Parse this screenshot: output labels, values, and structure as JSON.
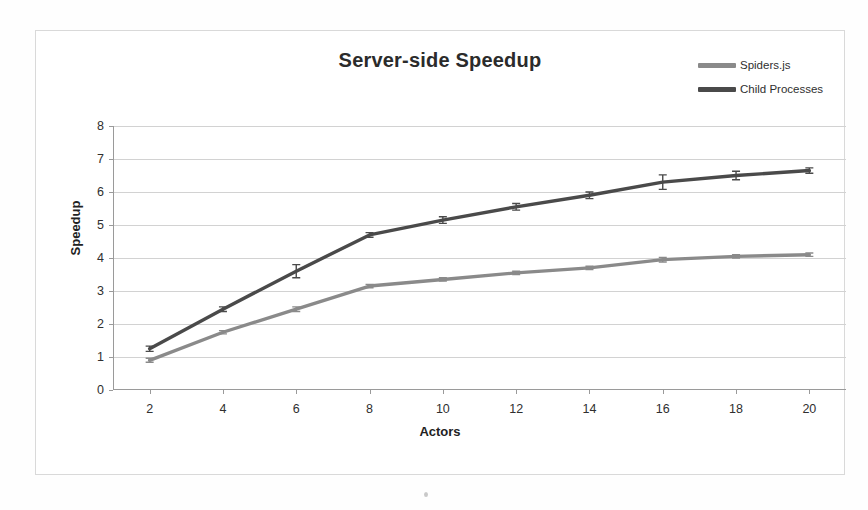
{
  "chart_data": {
    "type": "line",
    "title": "Server-side Speedup",
    "xlabel": "Actors",
    "ylabel": "Speedup",
    "x": [
      2,
      4,
      6,
      8,
      10,
      12,
      14,
      16,
      18,
      20
    ],
    "xlim": [
      1,
      21
    ],
    "ylim": [
      0,
      8
    ],
    "ytick_labels": [
      "0",
      "1",
      "2",
      "3",
      "4",
      "5",
      "6",
      "7",
      "8"
    ],
    "xtick_labels": [
      "2",
      "4",
      "6",
      "8",
      "10",
      "12",
      "14",
      "16",
      "18",
      "20"
    ],
    "grid": "horizontal",
    "legend_position": "top-right",
    "series": [
      {
        "name": "Spiders.js",
        "color": "#8a8a8a",
        "values": [
          0.9,
          1.75,
          2.45,
          3.15,
          3.35,
          3.55,
          3.7,
          3.95,
          4.05,
          4.1
        ],
        "error": [
          0.06,
          0.05,
          0.07,
          0.05,
          0.05,
          0.05,
          0.05,
          0.07,
          0.05,
          0.05
        ]
      },
      {
        "name": "Child Processes",
        "color": "#4a4a4a",
        "values": [
          1.25,
          2.45,
          3.6,
          4.7,
          5.15,
          5.55,
          5.9,
          6.3,
          6.5,
          6.65
        ],
        "error": [
          0.08,
          0.07,
          0.2,
          0.07,
          0.1,
          0.1,
          0.1,
          0.22,
          0.13,
          0.08
        ]
      }
    ]
  },
  "legend": {
    "items": [
      {
        "label": "Spiders.js",
        "color": "#8a8a8a"
      },
      {
        "label": "Child Processes",
        "color": "#4a4a4a"
      }
    ]
  }
}
